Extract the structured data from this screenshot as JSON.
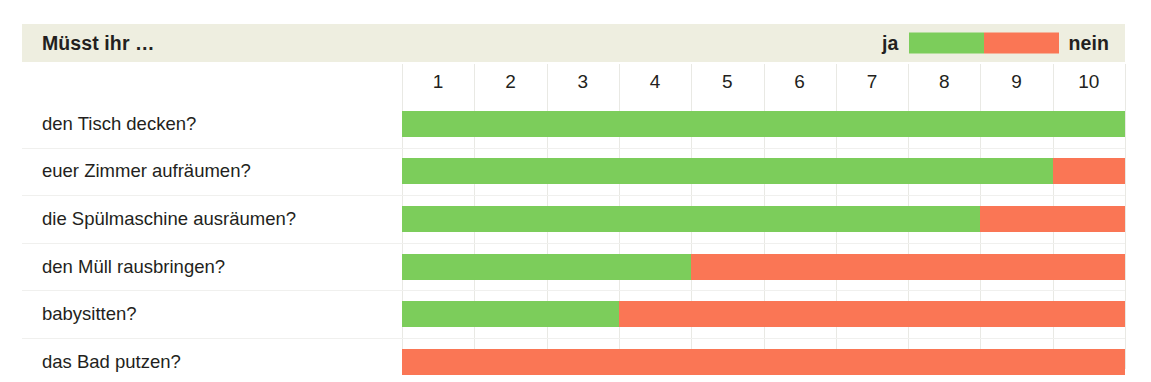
{
  "header": {
    "title": "Müsst ihr …",
    "legend": {
      "yes_label": "ja",
      "no_label": "nein"
    }
  },
  "colors": {
    "yes": "#7ccd5b",
    "no": "#fa7655",
    "header_band": "#eeeee0",
    "gridline": "#e9e9e4",
    "row_separator": "#f0f0ee",
    "text": "#231f20",
    "page_background": "#ffffff"
  },
  "chart_data": {
    "type": "bar",
    "orientation": "horizontal",
    "stacked": true,
    "title": "Müsst ihr …",
    "xlabel": "",
    "ylabel": "",
    "xlim": [
      0,
      10
    ],
    "grid": true,
    "legend_position": "top-right",
    "tick_labels": [
      "1",
      "2",
      "3",
      "4",
      "5",
      "6",
      "7",
      "8",
      "9",
      "10"
    ],
    "categories": [
      "den Tisch decken?",
      "euer Zimmer aufräumen?",
      "die Spülmaschine ausräumen?",
      "den Müll rausbringen?",
      "babysitten?",
      "das Bad putzen?"
    ],
    "series": [
      {
        "name": "ja",
        "color": "#7ccd5b",
        "values": [
          10,
          9,
          8,
          4,
          3,
          0
        ]
      },
      {
        "name": "nein",
        "color": "#fa7655",
        "values": [
          0,
          1,
          2,
          6,
          7,
          10
        ]
      }
    ],
    "rows": [
      {
        "label": "den Tisch decken?",
        "yes": 10,
        "no": 0
      },
      {
        "label": "euer Zimmer aufräumen?",
        "yes": 9,
        "no": 1
      },
      {
        "label": "die Spülmaschine ausräumen?",
        "yes": 8,
        "no": 2
      },
      {
        "label": "den Müll rausbringen?",
        "yes": 4,
        "no": 6
      },
      {
        "label": "babysitten?",
        "yes": 3,
        "no": 7
      },
      {
        "label": "das Bad putzen?",
        "yes": 0,
        "no": 10
      }
    ]
  }
}
